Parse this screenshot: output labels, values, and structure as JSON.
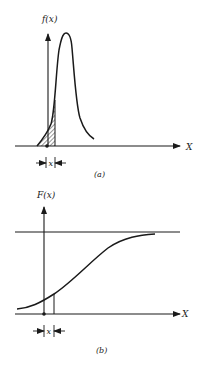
{
  "figure": {
    "panel_a": {
      "y_label": "f(x)",
      "x_label": "X",
      "interval_label": "x",
      "caption": "(a)",
      "description": "Probability density function with shaded area up to x"
    },
    "panel_b": {
      "y_label": "F(x)",
      "x_label": "X",
      "interval_label": "x",
      "caption": "(b)",
      "description": "Cumulative distribution function approaching an upper asymptote"
    },
    "colors": {
      "ink": "#1a1a1a",
      "background": "#ffffff"
    }
  }
}
